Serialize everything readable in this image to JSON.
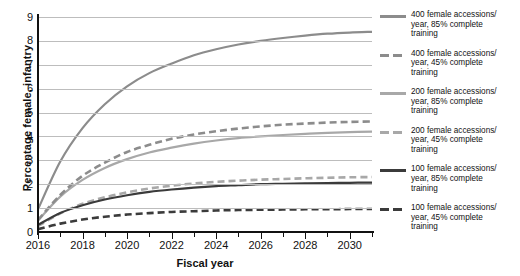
{
  "chart_data": {
    "type": "line",
    "title": "",
    "xlabel": "Fiscal year",
    "ylabel": "Percentage female, infantry",
    "xlim": [
      2016,
      2031
    ],
    "ylim": [
      0,
      9
    ],
    "grid": true,
    "legend_position": "right",
    "x_tick_labels": [
      "2016",
      "2018",
      "2020",
      "2022",
      "2024",
      "2026",
      "2028",
      "2030"
    ],
    "x_tick_values": [
      2016,
      2018,
      2020,
      2022,
      2024,
      2026,
      2028,
      2030
    ],
    "x_minor_tick_values": [
      2017,
      2019,
      2021,
      2023,
      2025,
      2027,
      2029,
      2031
    ],
    "y_tick_labels": [
      "0",
      "1",
      "2",
      "3",
      "4",
      "5",
      "6",
      "7",
      "8",
      "9"
    ],
    "y_tick_values": [
      0,
      1,
      2,
      3,
      4,
      5,
      6,
      7,
      8,
      9
    ],
    "x": [
      2016,
      2017,
      2018,
      2019,
      2020,
      2021,
      2022,
      2023,
      2024,
      2025,
      2026,
      2027,
      2028,
      2029,
      2030,
      2031
    ],
    "series": [
      {
        "name": "400 female accessions/year, 85% complete training",
        "accessions": 400,
        "completion_rate": "85%",
        "style": "solid",
        "color": "#8c8c8c",
        "values": [
          0.95,
          2.95,
          4.35,
          5.35,
          6.1,
          6.65,
          7.05,
          7.4,
          7.65,
          7.85,
          8.0,
          8.12,
          8.22,
          8.3,
          8.35,
          8.38
        ]
      },
      {
        "name": "400 female accessions/year, 45% complete training",
        "accessions": 400,
        "completion_rate": "45%",
        "style": "dashed",
        "color": "#8c8c8c",
        "values": [
          0.5,
          1.55,
          2.35,
          2.9,
          3.35,
          3.65,
          3.9,
          4.08,
          4.22,
          4.33,
          4.42,
          4.49,
          4.54,
          4.58,
          4.61,
          4.63
        ]
      },
      {
        "name": "200 female accessions/year, 85% complete training",
        "accessions": 200,
        "completion_rate": "85%",
        "style": "solid",
        "color": "#a8a8a8",
        "values": [
          0.48,
          1.48,
          2.18,
          2.68,
          3.05,
          3.33,
          3.53,
          3.7,
          3.83,
          3.93,
          4.0,
          4.06,
          4.11,
          4.15,
          4.18,
          4.2
        ]
      },
      {
        "name": "200 female accessions/year, 45% complete training",
        "accessions": 200,
        "completion_rate": "45%",
        "style": "dashed",
        "color": "#a8a8a8",
        "values": [
          0.25,
          0.78,
          1.18,
          1.45,
          1.66,
          1.82,
          1.94,
          2.03,
          2.1,
          2.15,
          2.19,
          2.22,
          2.25,
          2.27,
          2.29,
          2.3
        ]
      },
      {
        "name": "100 female accessions/year, 85% complete training",
        "accessions": 100,
        "completion_rate": "85%",
        "style": "solid",
        "color": "#3b3b3b",
        "values": [
          0.3,
          0.8,
          1.12,
          1.36,
          1.54,
          1.68,
          1.78,
          1.86,
          1.92,
          1.96,
          2.0,
          2.02,
          2.04,
          2.05,
          2.06,
          2.07
        ]
      },
      {
        "name": "100 female accessions/year, 45% complete training",
        "accessions": 100,
        "completion_rate": "45%",
        "style": "dashed",
        "color": "#3b3b3b",
        "values": [
          0.12,
          0.35,
          0.52,
          0.64,
          0.73,
          0.79,
          0.84,
          0.87,
          0.9,
          0.92,
          0.93,
          0.94,
          0.95,
          0.95,
          0.96,
          0.96
        ]
      }
    ]
  },
  "legend": {
    "entries": [
      {
        "line1": "400 female accessions/",
        "line2": "year, 85% complete",
        "line3": "training",
        "style": "solid",
        "color": "#8c8c8c"
      },
      {
        "line1": "400 female accessions/",
        "line2": "year, 45% complete",
        "line3": "training",
        "style": "dashed",
        "color": "#8c8c8c"
      },
      {
        "line1": "200 female accessions/",
        "line2": "year, 85% complete",
        "line3": "training",
        "style": "solid",
        "color": "#a8a8a8"
      },
      {
        "line1": "200 female accessions/",
        "line2": "year, 45% complete",
        "line3": "training",
        "style": "dashed",
        "color": "#a8a8a8"
      },
      {
        "line1": "100 female accessions/",
        "line2": "year, 85% complete",
        "line3": "training",
        "style": "solid",
        "color": "#3b3b3b"
      },
      {
        "line1": "100 female accessions/",
        "line2": "year, 45% complete",
        "line3": "training",
        "style": "dashed",
        "color": "#3b3b3b"
      }
    ]
  }
}
